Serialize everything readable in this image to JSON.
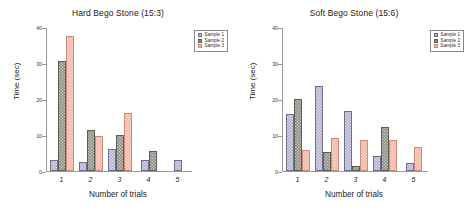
{
  "figure": {
    "xlabel": "Number of trials",
    "ylabel": "Time (sec)",
    "series_names": [
      "Sample 1",
      "Sample 2",
      "Sample 3"
    ],
    "colors": {
      "sample1": "#b3b0ce",
      "sample2": "#8f8f85",
      "sample3": "#f2b6a5"
    },
    "ytick_labels": [
      "40",
      "30",
      "20",
      "10",
      "0"
    ],
    "xtick_labels": [
      "1",
      "2",
      "3",
      "4",
      "5"
    ]
  },
  "chart_data": [
    {
      "type": "bar",
      "title": "Hard Bego Stone (15:3)",
      "xlabel": "Number of trials",
      "ylabel": "Time (sec)",
      "categories": [
        "1",
        "2",
        "3",
        "4",
        "5"
      ],
      "ylim": [
        0,
        40
      ],
      "yticks": [
        0,
        10,
        20,
        30,
        40
      ],
      "grid": false,
      "legend": "top-right",
      "series": [
        {
          "name": "Sample 1",
          "color": "#b3b0ce",
          "values": [
            3.0,
            2.5,
            6.0,
            3.0,
            3.0
          ]
        },
        {
          "name": "Sample 2",
          "color": "#8f8f85",
          "values": [
            30.5,
            11.5,
            10.0,
            5.5,
            0
          ]
        },
        {
          "name": "Sample 3",
          "color": "#f2b6a5",
          "values": [
            37.5,
            9.8,
            16.2,
            0,
            0
          ]
        }
      ]
    },
    {
      "type": "bar",
      "title": "Soft Bego Stone (15:6)",
      "xlabel": "Number of trials",
      "ylabel": "Time (sec)",
      "categories": [
        "1",
        "2",
        "3",
        "4",
        "5"
      ],
      "ylim": [
        0,
        40
      ],
      "yticks": [
        0,
        10,
        20,
        30,
        40
      ],
      "grid": false,
      "legend": "top-right",
      "series": [
        {
          "name": "Sample 1",
          "color": "#b3b0ce",
          "values": [
            15.7,
            23.5,
            16.6,
            4.2,
            2.3
          ]
        },
        {
          "name": "Sample 2",
          "color": "#8f8f85",
          "values": [
            20.0,
            5.3,
            1.3,
            12.2,
            0
          ]
        },
        {
          "name": "Sample 3",
          "color": "#f2b6a5",
          "values": [
            5.8,
            9.3,
            8.7,
            8.7,
            6.7
          ]
        }
      ]
    }
  ]
}
